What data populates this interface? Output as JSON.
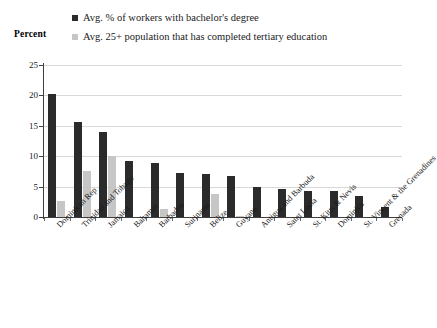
{
  "chart_data": {
    "type": "bar",
    "title": "",
    "xlabel": "",
    "ylabel": "Percent",
    "ylim": [
      0,
      25
    ],
    "yticks": [
      0,
      5,
      10,
      15,
      20,
      25
    ],
    "grid": true,
    "legend_position": "top",
    "categories": [
      "Dominican Rep",
      "Trinidad and Tobago",
      "Jamaica",
      "Bahamas",
      "Barbados",
      "Suriname",
      "Belize",
      "Guyana",
      "Antigua and Barbuda",
      "Saint Lucia",
      "St. Kitts & Nevis",
      "Dominica",
      "St. Vincent & the Grenadines",
      "Grenada"
    ],
    "series": [
      {
        "name": "Avg. % of workers with bachelor's degree",
        "color": "#2b2b2b",
        "values": [
          20.3,
          15.6,
          14.0,
          9.2,
          8.9,
          7.3,
          7.1,
          6.7,
          4.9,
          4.6,
          4.3,
          4.3,
          3.4,
          1.7
        ]
      },
      {
        "name": "Avg. 25+ population that has completed tertiary education",
        "color": "#c6c6c6",
        "values": [
          2.6,
          7.5,
          10.0,
          0,
          1.3,
          0,
          3.8,
          0.15,
          0,
          0,
          0,
          0,
          0,
          0
        ]
      }
    ]
  },
  "legend": {
    "items": [
      {
        "label": "Avg. % of workers with bachelor's degree",
        "color": "#2b2b2b",
        "marker": "square-marker-dark"
      },
      {
        "label": "Avg. 25+ population that has completed tertiary education",
        "color": "#c6c6c6",
        "marker": "square-marker-light"
      }
    ]
  },
  "axis": {
    "y_title": "Percent",
    "y_tick_labels": [
      "25",
      "20",
      "15",
      "10",
      "5",
      "0"
    ]
  }
}
